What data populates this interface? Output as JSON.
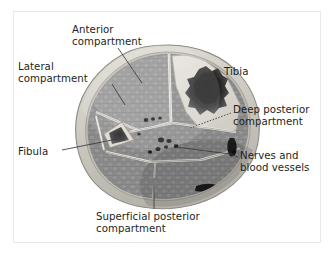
{
  "figure": {
    "kind": "anatomical-cross-section",
    "border_color": "#e8e8e8",
    "background_color": "#ffffff",
    "text_color": "#231f20"
  },
  "labels": {
    "anterior": {
      "line1": "Anterior",
      "line2": "compartment"
    },
    "lateral": {
      "line1": "Lateral",
      "line2": "compartment"
    },
    "tibia": {
      "line1": "Tibia",
      "line2": ""
    },
    "deep_posterior": {
      "line1": "Deep posterior",
      "line2": "compartment"
    },
    "nerves": {
      "line1": "Nerves and",
      "line2": "blood vessels"
    },
    "superficial_posterior": {
      "line1": "Superficial posterior",
      "line2": "compartment"
    },
    "fibula": {
      "line1": "Fibula",
      "line2": ""
    }
  },
  "structures": {
    "skin_color": "#d9d6cf",
    "subcutaneous_color": "#c9c6bf",
    "fascia_color": "#b4b1aa",
    "muscle_color": "#8f8f8f",
    "muscle_dark_color": "#7a7a7a",
    "bone_cortex_color": "#dcdad3",
    "bone_marrow_color": "#2e2e2e",
    "vessel_color": "#1c1c1c",
    "septum_color": "#efece5"
  }
}
